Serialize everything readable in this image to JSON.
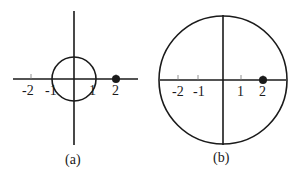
{
  "figure": {
    "stroke_color": "#1a1a1a",
    "background": "#ffffff",
    "panels": [
      {
        "caption": "(a)",
        "circle_radius_units": 1,
        "tick_labels": [
          "-2",
          "-1",
          "1",
          "2"
        ],
        "marked_point": {
          "x": 2,
          "y": 0,
          "label": "2"
        }
      },
      {
        "caption": "(b)",
        "circle_radius_units": 3,
        "tick_labels": [
          "-2",
          "-1",
          "1",
          "2"
        ],
        "marked_point": {
          "x": 2,
          "y": 0,
          "label": "2"
        }
      }
    ]
  }
}
